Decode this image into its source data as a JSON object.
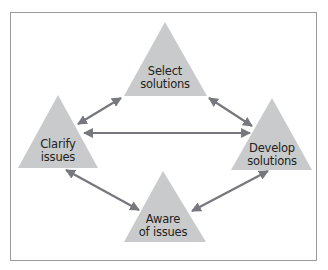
{
  "diagram": {
    "nodes": [
      {
        "id": "select",
        "label_line1": "Select",
        "label_line2": "solutions"
      },
      {
        "id": "clarify",
        "label_line1": "Clarify",
        "label_line2": "issues"
      },
      {
        "id": "develop",
        "label_line1": "Develop",
        "label_line2": "solutions"
      },
      {
        "id": "aware",
        "label_line1": "Aware",
        "label_line2": "of issues"
      }
    ],
    "edges": [
      {
        "from": "clarify",
        "to": "select",
        "bidirectional": true
      },
      {
        "from": "select",
        "to": "develop",
        "bidirectional": true
      },
      {
        "from": "clarify",
        "to": "develop",
        "bidirectional": true
      },
      {
        "from": "clarify",
        "to": "aware",
        "bidirectional": true
      },
      {
        "from": "aware",
        "to": "develop",
        "bidirectional": true
      }
    ],
    "colors": {
      "triangle_fill": "#c9cacb",
      "arrow": "#77787d",
      "frame_border": "#9a9a9a",
      "text": "#222222"
    }
  }
}
